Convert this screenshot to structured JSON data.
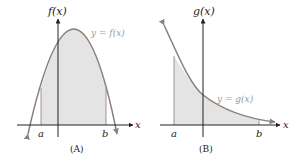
{
  "colors": {
    "curve": "#8a7f7a",
    "fill": "#e4e4e4",
    "axis": "#222222",
    "curve_label": "#9a9a9a"
  },
  "panel_a": {
    "y_axis_label": "f(x)",
    "x_axis_label": "x",
    "curve_label": "y = f(x)",
    "left_bound": "a",
    "right_bound": "b",
    "caption": "(A)"
  },
  "panel_b": {
    "y_axis_label": "g(x)",
    "x_axis_label": "x",
    "curve_label": "y = g(x)",
    "left_bound": "a",
    "right_bound": "b",
    "caption": "(B)"
  }
}
